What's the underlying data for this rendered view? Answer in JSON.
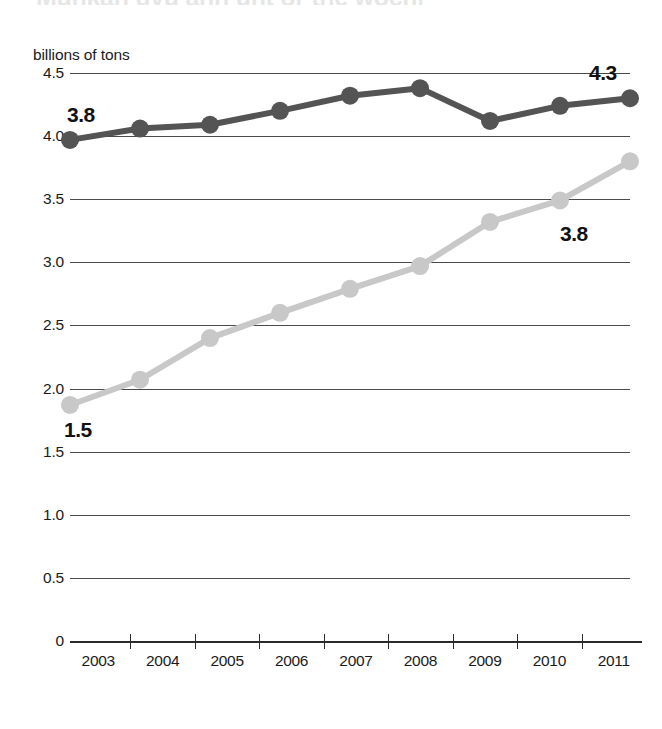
{
  "title": "Munkan uvu ann unt or the wochi",
  "axis_caption": "billions of tons",
  "colors": {
    "series_dark": "#545454",
    "series_light": "#c8c8c8",
    "gridline": "#4a4a4a",
    "axis": "#2b2b2b",
    "text": "#111111",
    "background": "#ffffff"
  },
  "callouts": {
    "dark_start": "3.8",
    "dark_end": "4.3",
    "light_start": "1.5",
    "light_end": "3.8"
  },
  "chart_data": {
    "type": "line",
    "title": "Munkan uvu ann unt or the wochi",
    "xlabel": "",
    "ylabel": "billions of tons",
    "ylim": [
      0,
      4.5
    ],
    "xlim": [
      "2003",
      "2011"
    ],
    "grid": true,
    "legend_position": "none",
    "yticks": [
      "0",
      "0.5",
      "1.0",
      "1.5",
      "2.0",
      "2.5",
      "3.0",
      "3.5",
      "4.0",
      "4.5"
    ],
    "ytick_values": [
      0,
      0.5,
      1.0,
      1.5,
      2.0,
      2.5,
      3.0,
      3.5,
      4.0,
      4.5
    ],
    "categories": [
      "2003",
      "2004",
      "2005",
      "2006",
      "2007",
      "2008",
      "2009",
      "2010",
      "2011"
    ],
    "series": [
      {
        "name": "dark-series",
        "color": "#545454",
        "values": [
          3.97,
          4.06,
          4.09,
          4.2,
          4.32,
          4.38,
          4.12,
          4.24,
          4.3
        ],
        "label_start": "3.8",
        "label_end": "4.3"
      },
      {
        "name": "light-series",
        "color": "#c8c8c8",
        "values": [
          1.87,
          2.07,
          2.4,
          2.6,
          2.79,
          2.97,
          3.32,
          3.49,
          3.8
        ],
        "label_start": "1.5",
        "label_end": "3.8"
      }
    ],
    "annotations": [
      {
        "text": "3.8",
        "series": "dark-series",
        "at": "2003",
        "position": "above-left"
      },
      {
        "text": "4.3",
        "series": "dark-series",
        "at": "2011",
        "position": "above-right"
      },
      {
        "text": "1.5",
        "series": "light-series",
        "at": "2003",
        "position": "below-left"
      },
      {
        "text": "3.8",
        "series": "light-series",
        "at": "2010",
        "position": "right"
      }
    ]
  }
}
